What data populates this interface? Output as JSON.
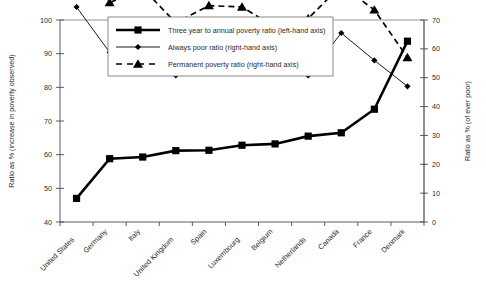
{
  "chart_data": {
    "type": "line",
    "title": "",
    "categories": [
      "United States",
      "Germany",
      "Italy",
      "United Kingdom",
      "Spain",
      "Luxembourg",
      "Belgium",
      "Netherlands",
      "Canada",
      "France",
      "Denmark"
    ],
    "series": [
      {
        "name": "Three year to annual poverty ratio (left-hand axis)",
        "axis": "left",
        "marker": "square",
        "line": "solid-thick",
        "values": [
          47.0,
          58.8,
          59.3,
          61.2,
          61.3,
          62.8,
          63.2,
          65.5,
          66.5,
          73.5,
          93.7
        ]
      },
      {
        "name": "Always poor ratio (right-hand axis)",
        "axis": "right",
        "marker": "diamond",
        "line": "solid-thin",
        "values": [
          74.5,
          58.8,
          62.5,
          50.8,
          54.6,
          54.6,
          54.8,
          50.8,
          65.5,
          56.0,
          47.0
        ]
      },
      {
        "name": "Permanent poverty ratio (right-hand axis)",
        "axis": "right",
        "marker": "triangle",
        "line": "dashed",
        "values": [
          93.0,
          76.0,
          81.0,
          69.0,
          75.0,
          74.5,
          67.5,
          70.5,
          82.0,
          73.5,
          57.0
        ]
      }
    ],
    "left_axis": {
      "label": "Ratio as % (increase in poverty observed)",
      "min": 40,
      "max": 100,
      "step": 10,
      "ticks": [
        "40",
        "50",
        "60",
        "70",
        "80",
        "90",
        "100"
      ]
    },
    "right_axis": {
      "label": "Ratio as % (of ever poor)",
      "min": 0,
      "max": 70,
      "step": 10,
      "ticks": [
        "0",
        "10",
        "20",
        "30",
        "40",
        "50",
        "60",
        "70"
      ]
    },
    "legend": {
      "position": "top-center",
      "entries": [
        "Three year to annual poverty ratio (left-hand axis)",
        "Always poor ratio (right-hand axis)",
        "Permanent poverty ratio (right-hand axis)"
      ]
    },
    "grid": false,
    "colors": {
      "series": "#000000",
      "axis": "#4a4a4a",
      "frame": "#8a8a8a",
      "background": "#ffffff"
    }
  }
}
